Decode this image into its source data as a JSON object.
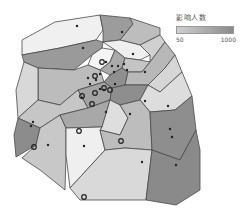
{
  "legend": {
    "title": "影响人数",
    "min_label": "50",
    "max_label": "1000",
    "gradient_start": "#cfcfcf",
    "gradient_end": "#8a8a8a"
  },
  "map": {
    "type": "voronoi-choropleth",
    "colors": {
      "very_light": "#f2f2f2",
      "light": "#d4d4d4",
      "mid": "#bcbcbc",
      "dark": "#9a9a9a",
      "darker": "#8a8a8a",
      "stroke": "#4a4a4a"
    }
  }
}
